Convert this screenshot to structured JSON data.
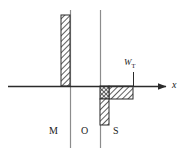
{
  "figure": {
    "name": "mos-charge-distribution-diagram",
    "type": "schematic",
    "background_color": "#ffffff",
    "line_color": "#3a3a3a",
    "hatch_color": "#2b2b2b"
  },
  "axes": {
    "x_axis": {
      "label": "x",
      "y_position": 86,
      "x_start": 8,
      "x_end": 170,
      "arrow": true
    },
    "vertical_boundaries": [
      {
        "name": "metal-oxide-interface",
        "x": 70,
        "y_top": 10,
        "y_bottom": 148
      },
      {
        "name": "oxide-semiconductor-interface",
        "x": 100,
        "y_top": 10,
        "y_bottom": 148
      }
    ]
  },
  "annotations": {
    "depletion_width": {
      "symbol": "W",
      "subscript": "T",
      "x": 133,
      "label_x": 124,
      "label_y": 62,
      "tick_top": 72,
      "tick_bottom": 86
    }
  },
  "regions": [
    {
      "id": "metal",
      "label": "M",
      "label_x": 49,
      "label_y": 131
    },
    {
      "id": "oxide",
      "label": "O",
      "label_x": 81,
      "label_y": 131
    },
    {
      "id": "semiconductor",
      "label": "S",
      "label_x": 113,
      "label_y": 131
    }
  ],
  "charge_blocks": [
    {
      "id": "metal-positive-charge",
      "name": "metal-charge-bar",
      "hatch": "diagonal",
      "x": 61,
      "y": 15,
      "width": 9,
      "height": 71,
      "sign": "positive"
    },
    {
      "id": "interface-inversion-charge",
      "name": "inversion-charge-block",
      "hatch": "crosshatch",
      "x": 100,
      "y": 86,
      "width": 9,
      "height": 13,
      "sign": "negative"
    },
    {
      "id": "depletion-charge",
      "name": "depletion-charge-block",
      "hatch": "diagonal",
      "x": 109,
      "y": 86,
      "width": 24,
      "height": 13,
      "sign": "negative"
    },
    {
      "id": "inversion-layer-tail",
      "name": "inversion-tail-bar",
      "hatch": "diagonal",
      "x": 100,
      "y": 99,
      "width": 9,
      "height": 26,
      "sign": "negative"
    }
  ]
}
